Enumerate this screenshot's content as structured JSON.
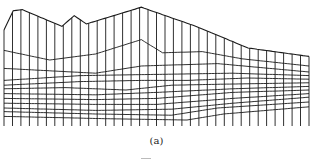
{
  "figure": {
    "caption": "(a)",
    "line_color": "#1a1a1a",
    "columns": 37,
    "layers": [
      {
        "name": "top-surface",
        "points": [
          [
            0,
            0.2
          ],
          [
            0.03,
            0.04
          ],
          [
            0.06,
            0.03
          ],
          [
            0.19,
            0.17
          ],
          [
            0.23,
            0.08
          ],
          [
            0.27,
            0.15
          ],
          [
            0.45,
            0.01
          ],
          [
            0.63,
            0.17
          ],
          [
            0.8,
            0.35
          ],
          [
            1.0,
            0.42
          ]
        ]
      },
      {
        "name": "layer-1",
        "points": [
          [
            0,
            0.37
          ],
          [
            0.15,
            0.45
          ],
          [
            0.3,
            0.4
          ],
          [
            0.45,
            0.28
          ],
          [
            0.52,
            0.39
          ],
          [
            0.65,
            0.38
          ],
          [
            0.78,
            0.44
          ],
          [
            1.0,
            0.5
          ]
        ]
      },
      {
        "name": "layer-2",
        "points": [
          [
            0,
            0.52
          ],
          [
            0.3,
            0.56
          ],
          [
            0.45,
            0.5
          ],
          [
            0.7,
            0.48
          ],
          [
            1.0,
            0.55
          ]
        ]
      },
      {
        "name": "layer-3",
        "points": [
          [
            0,
            0.62
          ],
          [
            0.25,
            0.58
          ],
          [
            0.5,
            0.57
          ],
          [
            0.75,
            0.56
          ],
          [
            1.0,
            0.58
          ]
        ]
      },
      {
        "name": "layer-4",
        "points": [
          [
            0,
            0.66
          ],
          [
            0.25,
            0.63
          ],
          [
            0.45,
            0.62
          ],
          [
            0.6,
            0.62
          ],
          [
            0.8,
            0.6
          ],
          [
            1.0,
            0.61
          ]
        ]
      },
      {
        "name": "layer-5",
        "points": [
          [
            0,
            0.69
          ],
          [
            0.2,
            0.68
          ],
          [
            0.4,
            0.7
          ],
          [
            0.55,
            0.66
          ],
          [
            0.75,
            0.65
          ],
          [
            1.0,
            0.64
          ]
        ]
      },
      {
        "name": "layer-6",
        "points": [
          [
            0,
            0.73
          ],
          [
            0.3,
            0.74
          ],
          [
            0.5,
            0.72
          ],
          [
            0.75,
            0.69
          ],
          [
            1.0,
            0.67
          ]
        ]
      },
      {
        "name": "layer-7",
        "points": [
          [
            0,
            0.77
          ],
          [
            0.3,
            0.78
          ],
          [
            0.5,
            0.77
          ],
          [
            0.75,
            0.72
          ],
          [
            1.0,
            0.7
          ]
        ]
      },
      {
        "name": "layer-8",
        "points": [
          [
            0,
            0.81
          ],
          [
            0.3,
            0.82
          ],
          [
            0.5,
            0.82
          ],
          [
            0.75,
            0.77
          ],
          [
            1.0,
            0.73
          ]
        ]
      },
      {
        "name": "layer-9",
        "points": [
          [
            0,
            0.85
          ],
          [
            0.3,
            0.87
          ],
          [
            0.55,
            0.86
          ],
          [
            0.75,
            0.81
          ],
          [
            1.0,
            0.76
          ]
        ]
      },
      {
        "name": "layer-10",
        "points": [
          [
            0,
            0.88
          ],
          [
            0.3,
            0.9
          ],
          [
            0.55,
            0.91
          ],
          [
            0.7,
            0.85
          ],
          [
            1.0,
            0.8
          ]
        ]
      },
      {
        "name": "layer-11",
        "points": [
          [
            0,
            0.92
          ],
          [
            0.35,
            0.94
          ],
          [
            0.6,
            0.95
          ],
          [
            0.72,
            0.9
          ],
          [
            1.0,
            0.84
          ]
        ]
      }
    ]
  }
}
